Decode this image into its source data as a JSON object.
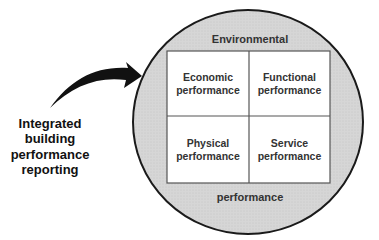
{
  "diagram": {
    "outer_label_top": "Environmental",
    "outer_label_bottom": "performance",
    "quadrants": [
      {
        "line1": "Economic",
        "line2": "performance"
      },
      {
        "line1": "Functional",
        "line2": "performance"
      },
      {
        "line1": "Physical",
        "line2": "performance"
      },
      {
        "line1": "Service",
        "line2": "performance"
      }
    ],
    "side_label": [
      "Integrated",
      "building",
      "performance",
      "reporting"
    ],
    "colors": {
      "circle_fill": "#d4d4d4",
      "circle_stroke": "#1a1a1a",
      "grid_fill": "#ffffff",
      "grid_stroke": "#555555",
      "arrow": "#111111"
    }
  }
}
